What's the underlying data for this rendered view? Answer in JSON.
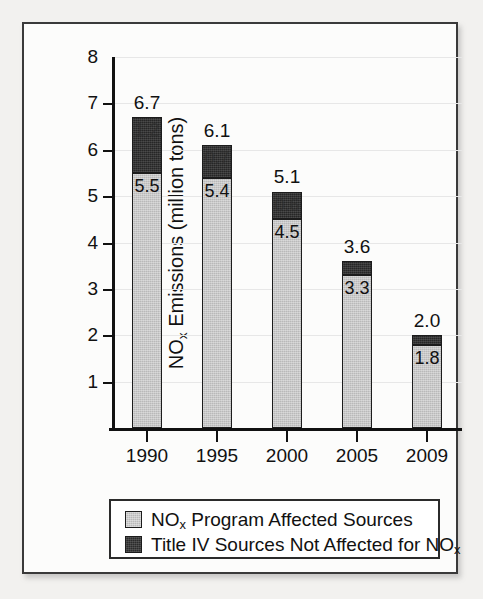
{
  "figure": {
    "background_color": "#f2f1ef",
    "card_color": "#fcfcfb",
    "border_color": "#3a3a3a"
  },
  "chart_data": {
    "type": "bar",
    "subtype": "stacked",
    "title": "",
    "xlabel": "",
    "ylabel": "NOₓ Emissions (million tons)",
    "ylabel_parts": {
      "pre": "NO",
      "sub": "x",
      "post": " Emissions (million tons)"
    },
    "categories": [
      "1990",
      "1995",
      "2000",
      "2005",
      "2009"
    ],
    "ylim": [
      0,
      8
    ],
    "yticks": [
      1,
      2,
      3,
      4,
      5,
      6,
      7,
      8
    ],
    "ytick_labels": [
      "1",
      "2",
      "3",
      "4",
      "5",
      "6",
      "7",
      "8"
    ],
    "grid": true,
    "legend_position": "below-axis",
    "series": [
      {
        "name": "NOₓ Program Affected Sources",
        "name_parts": {
          "pre": "NO",
          "sub": "x",
          "post": " Program Affected Sources"
        },
        "color": "#b9b9b9",
        "values": [
          5.5,
          5.4,
          4.5,
          3.3,
          1.8
        ],
        "value_labels": [
          "5.5",
          "5.4",
          "4.5",
          "3.3",
          "1.8"
        ]
      },
      {
        "name": "Title IV Sources Not Affected for NOₓ",
        "name_parts": {
          "pre": "Title IV Sources Not Affected for NO",
          "sub": "x",
          "post": ""
        },
        "color": "#262626",
        "values": [
          1.2,
          0.7,
          0.6,
          0.3,
          0.2
        ],
        "value_labels": [
          "1.2",
          "0.7",
          "0.6",
          "0.3",
          "0.2"
        ]
      }
    ],
    "totals": [
      6.7,
      6.1,
      5.1,
      3.6,
      2.0
    ],
    "total_labels": [
      "6.7",
      "6.1",
      "5.1",
      "3.6",
      "2.0"
    ]
  },
  "legend": {
    "items": [
      {
        "label": "NOₓ Program Affected Sources",
        "parts": {
          "pre": "NO",
          "sub": "x",
          "post": " Program Affected Sources"
        },
        "swatch_color": "#b9b9b9"
      },
      {
        "label": "Title IV Sources Not Affected for NOₓ",
        "parts": {
          "pre": "Title IV Sources Not Affected for NO",
          "sub": "x",
          "post": ""
        },
        "swatch_color": "#2b2b2b"
      }
    ]
  }
}
